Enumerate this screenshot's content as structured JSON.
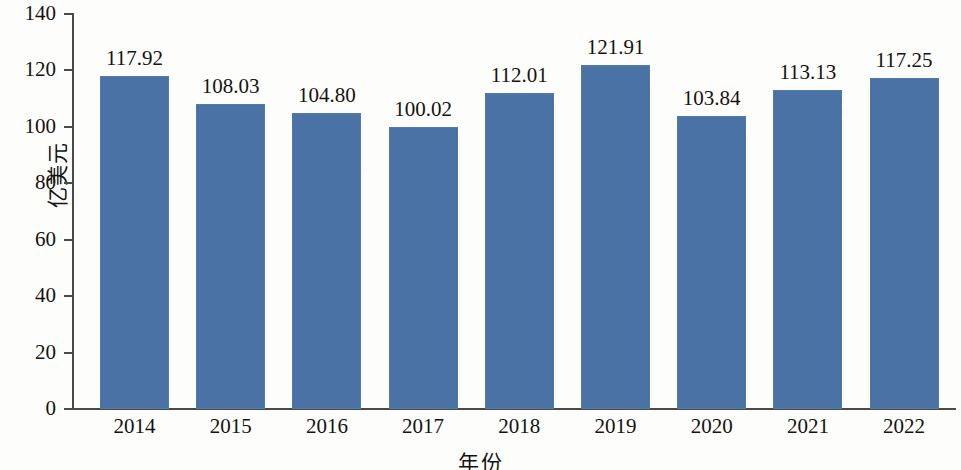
{
  "chart_data": {
    "type": "bar",
    "title": "",
    "subtitle": "",
    "xlabel": "年份",
    "ylabel": "亿美元",
    "categories": [
      "2014",
      "2015",
      "2016",
      "2017",
      "2018",
      "2019",
      "2020",
      "2021",
      "2022"
    ],
    "values": [
      117.92,
      108.03,
      104.8,
      100.02,
      112.01,
      121.91,
      103.84,
      113.13,
      117.25
    ],
    "value_labels": [
      "117.92",
      "108.03",
      "104.80",
      "100.02",
      "112.01",
      "121.91",
      "103.84",
      "113.13",
      "117.25"
    ],
    "series": [
      {
        "name": "亿美元",
        "values": [
          117.92,
          108.03,
          104.8,
          100.02,
          112.01,
          121.91,
          103.84,
          113.13,
          117.25
        ]
      }
    ],
    "ylim": [
      0,
      140
    ],
    "y_ticks": [
      0,
      20,
      40,
      60,
      80,
      100,
      120,
      140
    ],
    "y_tick_labels": [
      "0",
      "20",
      "40",
      "60",
      "80",
      "100",
      "120",
      "140"
    ],
    "grid": false,
    "legend": false,
    "legend_position": "none",
    "bar_color": "#4a72a4",
    "axis_color": "#4a4a48",
    "text_color": "#15130f",
    "background_color": "#fdfdfc"
  }
}
